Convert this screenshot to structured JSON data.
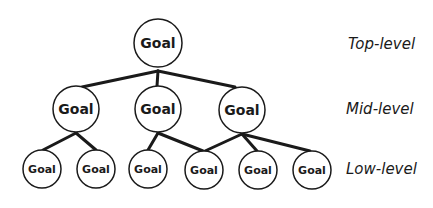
{
  "diagram": {
    "type": "hierarchy-tree",
    "levels": [
      {
        "label": "Top-level"
      },
      {
        "label": "Mid-level"
      },
      {
        "label": "Low-level"
      }
    ],
    "nodes": {
      "top": {
        "label": "Goal"
      },
      "mid": [
        {
          "label": "Goal"
        },
        {
          "label": "Goal"
        },
        {
          "label": "Goal"
        }
      ],
      "low": [
        {
          "label": "Goal"
        },
        {
          "label": "Goal"
        },
        {
          "label": "Goal"
        },
        {
          "label": "Goal"
        },
        {
          "label": "Goal"
        },
        {
          "label": "Goal"
        }
      ]
    },
    "edges": [
      [
        "top",
        "mid-1"
      ],
      [
        "top",
        "mid-2"
      ],
      [
        "top",
        "mid-3"
      ],
      [
        "mid-1",
        "low-1"
      ],
      [
        "mid-1",
        "low-2"
      ],
      [
        "mid-2",
        "low-3"
      ],
      [
        "mid-2",
        "low-4"
      ],
      [
        "mid-3",
        "low-4"
      ],
      [
        "mid-3",
        "low-5"
      ],
      [
        "mid-3",
        "low-6"
      ]
    ],
    "colors": {
      "stroke": "#1a1a1a",
      "fill": "#ffffff",
      "text": "#1a1a1a"
    }
  }
}
